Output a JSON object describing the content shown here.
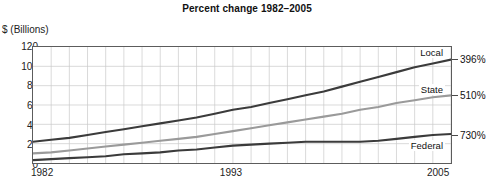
{
  "chart_data": {
    "type": "line",
    "title": "Percent change 1982–2005",
    "ylabel": "$ (Billions)",
    "xlabel": "",
    "ylim": [
      0,
      120
    ],
    "xlim": [
      1982,
      2005
    ],
    "grid": true,
    "legend_position": "inline-right",
    "y_ticks": [
      "0",
      "20",
      "40",
      "60",
      "80",
      "100",
      "120"
    ],
    "y_tick_values": [
      0,
      20,
      40,
      60,
      80,
      100,
      120
    ],
    "x_ticks": [
      "1982",
      "1993",
      "2005"
    ],
    "x_tick_values": [
      1982,
      1993,
      2005
    ],
    "x": [
      1982,
      1983,
      1984,
      1985,
      1986,
      1987,
      1988,
      1989,
      1990,
      1991,
      1992,
      1993,
      1994,
      1995,
      1996,
      1997,
      1998,
      1999,
      2000,
      2001,
      2002,
      2003,
      2004,
      2005
    ],
    "series": [
      {
        "name": "Local",
        "color": "#3b3b3b",
        "annotation": "396%",
        "values": [
          22,
          24,
          26,
          29,
          32,
          35,
          38,
          41,
          44,
          47,
          51,
          55,
          58,
          62,
          66,
          70,
          74,
          79,
          84,
          89,
          94,
          99,
          103,
          107
        ]
      },
      {
        "name": "State",
        "color": "#9a9a9a",
        "annotation": "510%",
        "values": [
          10,
          11,
          13,
          15,
          17,
          19,
          21,
          23,
          25,
          27,
          30,
          33,
          36,
          39,
          42,
          45,
          48,
          51,
          55,
          58,
          62,
          65,
          68,
          70
        ]
      },
      {
        "name": "Federal",
        "color": "#3b3b3b",
        "annotation": "730%",
        "values": [
          3,
          4,
          5,
          6,
          7,
          9,
          10,
          11,
          13,
          14,
          16,
          18,
          19,
          20,
          21,
          22,
          22,
          22,
          22,
          23,
          25,
          27,
          29,
          30
        ]
      }
    ],
    "annotations": [
      {
        "text": "396%",
        "series": "Local",
        "value": 107
      },
      {
        "text": "510%",
        "series": "State",
        "value": 70
      },
      {
        "text": "730%",
        "series": "Federal",
        "value": 30
      }
    ]
  }
}
